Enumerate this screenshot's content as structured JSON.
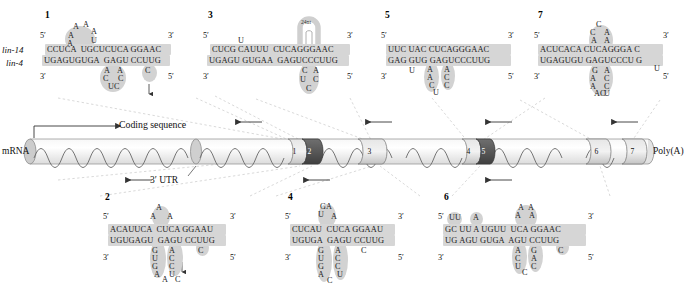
{
  "figure": {
    "gene_top": "lin-14",
    "gene_bottom": "lin-4",
    "five_prime": "5′",
    "three_prime": "3′"
  },
  "mrna": {
    "label": "mRNA",
    "coding_label": "Coding sequence",
    "utr_label": "3′ UTR",
    "polya_label": "Poly(A)",
    "site_numbers": [
      "1",
      "2",
      "3",
      "4",
      "5",
      "6",
      "7"
    ],
    "colors": {
      "body": "#ededed",
      "body_edge": "#8a8a8a",
      "wave": "#6e6e6e",
      "site_light": "#d8d8d8",
      "site_dark": "#5d5d5d",
      "cap": "#cfcfcf",
      "leader": "#c9c9c9"
    }
  },
  "sites": [
    {
      "id": "1",
      "number": "1",
      "top_seq": "CCUCA  UGCUCUCA GGAAC",
      "bottom_seq": "UGAGUGUGA  GAGU CCUUG",
      "top_left_prime": "5′",
      "top_right_prime": "3′",
      "bottom_left_prime": "3′",
      "bottom_right_prime": "5′",
      "upper_loop": [
        "A",
        "A",
        "A",
        "A",
        "U"
      ],
      "lower_loop": [
        "A",
        "C",
        "U",
        "C",
        "A",
        "C"
      ],
      "bulge_char": "C",
      "has_arrow": true
    },
    {
      "id": "2",
      "number": "2",
      "top_seq": "ACAUUCA  CUCA GGAAU",
      "bottom_seq": "UGUGAGU  GAGU CCUUG",
      "top_left_prime": "5′",
      "top_right_prime": "3′",
      "bottom_left_prime": "3′",
      "bottom_right_prime": "5′",
      "upper_loop": [
        "A",
        "A",
        "A"
      ],
      "lower_loop": [
        "G",
        "U",
        "G",
        "A",
        "A",
        "C",
        "A",
        "C",
        "C",
        "U",
        "C"
      ],
      "bulge_char": "C",
      "has_arrow": true
    },
    {
      "id": "3",
      "number": "3",
      "top_seq": "CUCG CAUUU  CUCAGGGAAC",
      "bottom_seq": "UGAGU GUGAA  GAGUCCCUUG",
      "top_left_prime": "5′",
      "top_right_prime": "3′",
      "bottom_left_prime": "3′",
      "bottom_right_prime": "5′",
      "hairpin_label": "24nt",
      "upper_loop": [
        "U"
      ],
      "lower_loop": [
        "C",
        "A",
        "U",
        "C",
        "C"
      ],
      "has_arrow": false
    },
    {
      "id": "4",
      "number": "4",
      "top_seq": "CUCAU  CUCA GGAAU",
      "bottom_seq": "UGUGA  GAGU CCUUG",
      "top_left_prime": "5′",
      "top_right_prime": "3′",
      "bottom_left_prime": "3′",
      "bottom_right_prime": "5′",
      "upper_loop": [
        "G",
        "A",
        "U",
        "A"
      ],
      "lower_loop": [
        "G",
        "U",
        "G",
        "A",
        "A",
        "C",
        "A",
        "C",
        "C",
        "U"
      ],
      "bulge_char": "C",
      "has_arrow": false
    },
    {
      "id": "5",
      "number": "5",
      "top_seq": "UUC UAC CUCAGGGAAC",
      "bottom_seq": "GAG GUG GAGUCCCUUG",
      "top_left_prime": "5′",
      "top_right_prime": "3′",
      "bottom_left_prime": "3′",
      "bottom_right_prime": "5′",
      "upper_loop": [],
      "lower_loop": [
        "U",
        "A",
        "A",
        "C",
        "U",
        "A",
        "C",
        "C"
      ],
      "has_arrow": false
    },
    {
      "id": "6",
      "number": "6",
      "top_seq": "GC UU A UGUU  UCA GGAAC",
      "bottom_seq": "UG AGU GUGA  AGU CCUUG",
      "top_left_prime": "5′",
      "top_right_prime": "3′",
      "bottom_left_prime": "3′",
      "bottom_right_prime": "5′",
      "upper_loop": [
        "UU",
        "A",
        "A",
        "A",
        "A",
        "A"
      ],
      "lower_loop": [
        "A",
        "C",
        "U",
        "C",
        "G",
        "A",
        "C",
        "C"
      ],
      "bulge_char": "C",
      "has_arrow": false
    },
    {
      "id": "7",
      "number": "7",
      "top_seq": "ACUCACA CUCAGGGA C",
      "bottom_seq": "UGAGUGU GAGUCCCU G",
      "top_left_prime": "5′",
      "top_right_prime": "3′",
      "bottom_left_prime": "3′",
      "bottom_right_prime": "5′",
      "upper_loop": [
        "C",
        "C",
        "A",
        "A",
        "A"
      ],
      "lower_loop": [
        "G",
        "A",
        "A",
        "A",
        "C",
        "U",
        "A",
        "C",
        "C"
      ],
      "tail_char": "U",
      "has_arrow": false
    }
  ]
}
